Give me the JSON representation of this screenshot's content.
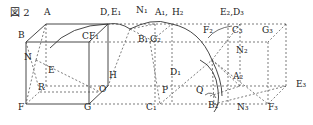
{
  "figure": {
    "title": "図 2",
    "stroke_color": "#333333",
    "labels": [
      {
        "id": "A",
        "text": "A",
        "x": 44,
        "y": 15
      },
      {
        "id": "B",
        "text": "B",
        "x": 18,
        "y": 38
      },
      {
        "id": "C",
        "text": "C",
        "x": 82,
        "y": 39
      },
      {
        "id": "F1",
        "text": "F₁",
        "x": 89,
        "y": 39
      },
      {
        "id": "D",
        "text": "D,",
        "x": 100,
        "y": 15
      },
      {
        "id": "E1",
        "text": "E₁",
        "x": 111,
        "y": 15
      },
      {
        "id": "N1",
        "text": "N₁",
        "x": 136,
        "y": 13
      },
      {
        "id": "A1",
        "text": "A₁,",
        "x": 155,
        "y": 15
      },
      {
        "id": "H2",
        "text": "H₂",
        "x": 172,
        "y": 15
      },
      {
        "id": "B1",
        "text": "B₁",
        "x": 138,
        "y": 42
      },
      {
        "id": "G2",
        "text": "G₂",
        "x": 150,
        "y": 42
      },
      {
        "id": "E2",
        "text": "E₂,",
        "x": 220,
        "y": 15
      },
      {
        "id": "D3",
        "text": "D₃",
        "x": 233,
        "y": 15
      },
      {
        "id": "F2",
        "text": "F₂",
        "x": 203,
        "y": 33
      },
      {
        "id": "C3",
        "text": "C₃",
        "x": 232,
        "y": 33
      },
      {
        "id": "G3",
        "text": "G₃",
        "x": 262,
        "y": 33
      },
      {
        "id": "N2",
        "text": "N₂",
        "x": 236,
        "y": 53
      },
      {
        "id": "N",
        "text": "N",
        "x": 24,
        "y": 60
      },
      {
        "id": "E",
        "text": "E",
        "x": 48,
        "y": 73
      },
      {
        "id": "H",
        "text": "H",
        "x": 109,
        "y": 78
      },
      {
        "id": "D1",
        "text": "D₁",
        "x": 170,
        "y": 75
      },
      {
        "id": "A2",
        "text": "A₂",
        "x": 233,
        "y": 79
      },
      {
        "id": "R",
        "text": "R",
        "x": 38,
        "y": 90
      },
      {
        "id": "O",
        "text": "O",
        "x": 99,
        "y": 92
      },
      {
        "id": "P",
        "text": "P",
        "x": 162,
        "y": 93
      },
      {
        "id": "Q",
        "text": "Q",
        "x": 196,
        "y": 93
      },
      {
        "id": "E3",
        "text": "E₃",
        "x": 296,
        "y": 87
      },
      {
        "id": "F",
        "text": "F",
        "x": 18,
        "y": 110
      },
      {
        "id": "G",
        "text": "G",
        "x": 84,
        "y": 110
      },
      {
        "id": "C1",
        "text": "C₁",
        "x": 146,
        "y": 110
      },
      {
        "id": "B2",
        "text": "B₂",
        "x": 208,
        "y": 108
      },
      {
        "id": "N3",
        "text": "N₃",
        "x": 237,
        "y": 110
      },
      {
        "id": "F3",
        "text": "F₃",
        "x": 268,
        "y": 110
      }
    ]
  }
}
